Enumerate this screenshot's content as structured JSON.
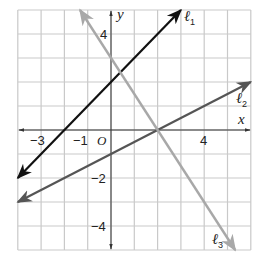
{
  "graph": {
    "x_range": [
      -4,
      6
    ],
    "y_range": [
      -5,
      5
    ],
    "origin_label": "O",
    "x_axis_label": "x",
    "y_axis_label": "y",
    "tick_labels": {
      "x": [
        {
          "value": -3,
          "text": "−3"
        },
        {
          "value": -1,
          "text": "−1"
        },
        {
          "value": 4,
          "text": "4"
        }
      ],
      "y": [
        {
          "value": 4,
          "text": "4"
        },
        {
          "value": -2,
          "text": "−2"
        },
        {
          "value": -4,
          "text": "−4"
        }
      ]
    },
    "colors": {
      "grid": "#c9c9c9",
      "axis": "#333333",
      "l1": "#111111",
      "l2": "#555555",
      "l3": "#a8a8a8"
    },
    "lines": [
      {
        "id": "l1",
        "label": "ℓ",
        "sub": "1",
        "equation": "y = x + 2",
        "from": [
          -4,
          -2
        ],
        "to": [
          3,
          5
        ]
      },
      {
        "id": "l2",
        "label": "ℓ",
        "sub": "2",
        "equation": "y = 0.5x - 1",
        "from": [
          -4,
          -3
        ],
        "to": [
          6,
          2
        ]
      },
      {
        "id": "l3",
        "label": "ℓ",
        "sub": "3",
        "equation": "y = -1.5x + 3",
        "from": [
          -1.33,
          5
        ],
        "to": [
          5.33,
          -5
        ]
      }
    ]
  }
}
